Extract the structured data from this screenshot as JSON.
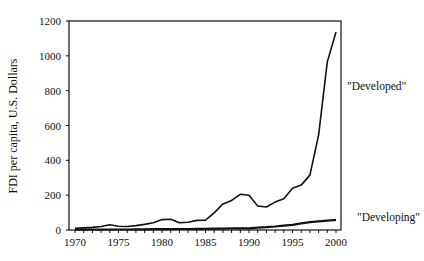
{
  "chart_data": {
    "type": "line",
    "title": "",
    "xlabel": "",
    "ylabel": "FDI per capita, U.S. Dollars",
    "xlim": [
      1970,
      2000
    ],
    "ylim": [
      0,
      1200
    ],
    "grid": false,
    "legend": "inline labels at right",
    "x_ticks": [
      1970,
      1975,
      1980,
      1985,
      1990,
      1995,
      2000
    ],
    "y_ticks": [
      0,
      200,
      400,
      600,
      800,
      1000,
      1200
    ],
    "x": [
      1970,
      1971,
      1972,
      1973,
      1974,
      1975,
      1976,
      1977,
      1978,
      1979,
      1980,
      1981,
      1982,
      1983,
      1984,
      1985,
      1986,
      1987,
      1988,
      1989,
      1990,
      1991,
      1992,
      1993,
      1994,
      1995,
      1996,
      1997,
      1998,
      1999,
      2000
    ],
    "series": [
      {
        "name": "\"Developed\"",
        "values": [
          10,
          12,
          15,
          20,
          30,
          22,
          20,
          25,
          32,
          42,
          60,
          62,
          42,
          45,
          55,
          57,
          98,
          150,
          170,
          205,
          200,
          138,
          132,
          160,
          180,
          240,
          258,
          315,
          545,
          965,
          1137
        ]
      },
      {
        "name": "\"Developing\"",
        "values": [
          2,
          2,
          2,
          3,
          3,
          3,
          3,
          4,
          4,
          5,
          5,
          5,
          6,
          6,
          7,
          7,
          8,
          8,
          9,
          10,
          10,
          13,
          16,
          20,
          25,
          30,
          38,
          45,
          50,
          54,
          58
        ]
      }
    ]
  }
}
